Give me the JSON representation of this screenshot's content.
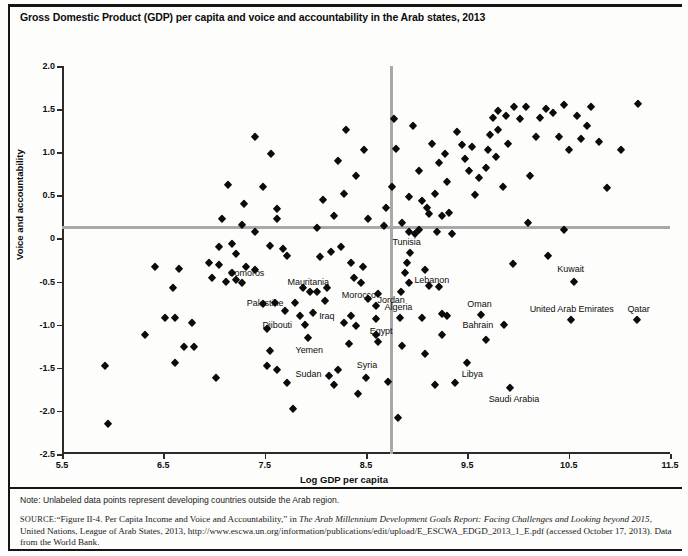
{
  "figure": {
    "title": "Gross Domestic Product (GDP) per capita and voice and accountability in the Arab states, 2013",
    "note": "Note: Unlabeled data points represent developing countries outside the Arab region.",
    "source": {
      "tag": "SOURCE:",
      "part1": "“Figure II-4. Per Capita Income and Voice and Accountability,” in ",
      "italic1": "The Arab Millennium Development Goals Report: Facing Challenges and Looking beyond 2015",
      "part2": ", United Nations, League of Arab States, 2013, http://www.escwa.un.org/information/publications/edit/upload/E_ESCWA_EDGD_2013_1_E.pdf (accessed October 17, 2013). Data from the World Bank."
    },
    "colors": {
      "marker": "#0b0b0b",
      "reference_line": "#a9a9a9",
      "axis": "#2b2b2b",
      "background": "#fdfdfc"
    }
  },
  "chart_data": {
    "type": "scatter",
    "title": "Gross Domestic Product (GDP) per capita and voice and accountability in the Arab states, 2013",
    "xlabel": "Log GDP per capita",
    "ylabel": "Voice and accountability",
    "xlim": [
      5.5,
      11.5
    ],
    "ylim": [
      -2.5,
      2.0
    ],
    "xticks": [
      "5.5",
      "6.5",
      "7.5",
      "8.5",
      "9.5",
      "10.5",
      "11.5"
    ],
    "xtick_values": [
      5.5,
      6.5,
      7.5,
      8.5,
      9.5,
      10.5,
      11.5
    ],
    "yticks": [
      "2.0",
      "1.5",
      "1.0",
      "0.5",
      "0",
      "-0.5",
      "-1.0",
      "-1.5",
      "-2.0",
      "-2.5"
    ],
    "ytick_values": [
      2.0,
      1.5,
      1.0,
      0.5,
      0,
      -0.5,
      -1.0,
      -1.5,
      -2.0,
      -2.5
    ],
    "grid": false,
    "legend": null,
    "reference_lines": {
      "horizontal_y": 0.13,
      "vertical_x": 8.75
    },
    "labeled_points": [
      {
        "label": "Comoros",
        "x": 7.18,
        "y": -0.4,
        "label_dx": 14,
        "label_dy": 0
      },
      {
        "label": "Mauritania",
        "x": 7.95,
        "y": -0.62,
        "label_dx": -2,
        "label_dy": -10
      },
      {
        "label": "Palestine",
        "x": 7.8,
        "y": -0.75,
        "label_dx": -30,
        "label_dy": 0
      },
      {
        "label": "Djibouti",
        "x": 7.9,
        "y": -1.0,
        "label_dx": -28,
        "label_dy": 0
      },
      {
        "label": "Yemen",
        "x": 7.93,
        "y": -1.15,
        "label_dx": 1,
        "label_dy": 12
      },
      {
        "label": "Sudan",
        "x": 8.13,
        "y": -1.6,
        "label_dx": -20,
        "label_dy": -2
      },
      {
        "label": "Morocco",
        "x": 8.45,
        "y": -0.52,
        "label_dx": -2,
        "label_dy": 12
      },
      {
        "label": "Jordan",
        "x": 8.62,
        "y": -0.65,
        "label_dx": 13,
        "label_dy": 6
      },
      {
        "label": "Iraq",
        "x": 8.35,
        "y": -0.9,
        "label_dx": -24,
        "label_dy": 0
      },
      {
        "label": "Egypt",
        "x": 8.6,
        "y": -0.93,
        "label_dx": 5,
        "label_dy": 12
      },
      {
        "label": "Syria",
        "x": 8.5,
        "y": -1.62,
        "label_dx": 1,
        "label_dy": -13
      },
      {
        "label": "Algeria",
        "x": 8.84,
        "y": -0.92,
        "label_dx": -2,
        "label_dy": -11
      },
      {
        "label": "Tunisia",
        "x": 8.93,
        "y": -0.17,
        "label_dx": -3,
        "label_dy": -11
      },
      {
        "label": "Lebanon",
        "x": 9.08,
        "y": -0.37,
        "label_dx": 7,
        "label_dy": 10
      },
      {
        "label": "Oman",
        "x": 9.63,
        "y": -0.89,
        "label_dx": -1,
        "label_dy": -11
      },
      {
        "label": "Bahrain",
        "x": 9.86,
        "y": -1.0,
        "label_dx": -26,
        "label_dy": 0
      },
      {
        "label": "Libya",
        "x": 9.5,
        "y": -1.44,
        "label_dx": 5,
        "label_dy": 11
      },
      {
        "label": "Saudi Arabia",
        "x": 9.92,
        "y": -1.73,
        "label_dx": 4,
        "label_dy": 11
      },
      {
        "label": "Kuwait",
        "x": 10.55,
        "y": -0.5,
        "label_dx": -3,
        "label_dy": -13
      },
      {
        "label": "United Arab Emirates",
        "x": 10.52,
        "y": -0.95,
        "label_dx": 1,
        "label_dy": -11
      },
      {
        "label": "Qatar",
        "x": 11.17,
        "y": -0.95,
        "label_dx": 2,
        "label_dy": -11
      }
    ],
    "unlabeled_points": [
      {
        "x": 5.92,
        "y": -1.48
      },
      {
        "x": 5.95,
        "y": -2.15
      },
      {
        "x": 6.42,
        "y": -0.33
      },
      {
        "x": 6.65,
        "y": -0.35
      },
      {
        "x": 6.6,
        "y": -0.58
      },
      {
        "x": 6.52,
        "y": -0.92
      },
      {
        "x": 6.62,
        "y": -0.92
      },
      {
        "x": 6.78,
        "y": -0.98
      },
      {
        "x": 6.32,
        "y": -1.12
      },
      {
        "x": 6.7,
        "y": -1.26
      },
      {
        "x": 6.8,
        "y": -1.26
      },
      {
        "x": 6.62,
        "y": -1.44
      },
      {
        "x": 7.02,
        "y": -1.62
      },
      {
        "x": 6.95,
        "y": -0.28
      },
      {
        "x": 7.05,
        "y": -0.31
      },
      {
        "x": 6.98,
        "y": -0.46
      },
      {
        "x": 7.12,
        "y": -0.5
      },
      {
        "x": 7.22,
        "y": -0.48
      },
      {
        "x": 7.28,
        "y": -0.52
      },
      {
        "x": 7.32,
        "y": -0.33
      },
      {
        "x": 7.4,
        "y": -0.37
      },
      {
        "x": 7.22,
        "y": -0.18
      },
      {
        "x": 7.05,
        "y": -0.1
      },
      {
        "x": 7.18,
        "y": -0.06
      },
      {
        "x": 7.4,
        "y": 0.08
      },
      {
        "x": 7.28,
        "y": 0.16
      },
      {
        "x": 7.08,
        "y": 0.22
      },
      {
        "x": 7.3,
        "y": 0.4
      },
      {
        "x": 7.14,
        "y": 0.62
      },
      {
        "x": 7.4,
        "y": 1.18
      },
      {
        "x": 7.48,
        "y": 0.6
      },
      {
        "x": 7.56,
        "y": 0.98
      },
      {
        "x": 7.62,
        "y": 0.34
      },
      {
        "x": 7.62,
        "y": 0.22
      },
      {
        "x": 7.55,
        "y": -0.09
      },
      {
        "x": 7.68,
        "y": -0.12
      },
      {
        "x": 7.72,
        "y": -0.2
      },
      {
        "x": 7.48,
        "y": -0.76
      },
      {
        "x": 7.6,
        "y": -0.75
      },
      {
        "x": 7.7,
        "y": -0.84
      },
      {
        "x": 7.85,
        "y": -0.9
      },
      {
        "x": 7.52,
        "y": -1.05
      },
      {
        "x": 7.55,
        "y": -1.3
      },
      {
        "x": 7.52,
        "y": -1.48
      },
      {
        "x": 7.62,
        "y": -1.52
      },
      {
        "x": 7.72,
        "y": -1.68
      },
      {
        "x": 7.78,
        "y": -1.98
      },
      {
        "x": 7.88,
        "y": -0.58
      },
      {
        "x": 8.02,
        "y": -0.62
      },
      {
        "x": 8.1,
        "y": -0.72
      },
      {
        "x": 7.98,
        "y": -0.86
      },
      {
        "x": 8.12,
        "y": -0.58
      },
      {
        "x": 8.05,
        "y": -0.21
      },
      {
        "x": 8.15,
        "y": -0.16
      },
      {
        "x": 8.25,
        "y": -0.1
      },
      {
        "x": 8.02,
        "y": 0.12
      },
      {
        "x": 8.18,
        "y": 0.26
      },
      {
        "x": 8.08,
        "y": 0.45
      },
      {
        "x": 8.28,
        "y": 0.52
      },
      {
        "x": 8.22,
        "y": 0.9
      },
      {
        "x": 8.4,
        "y": 0.72
      },
      {
        "x": 8.3,
        "y": 1.26
      },
      {
        "x": 8.48,
        "y": 1.02
      },
      {
        "x": 8.35,
        "y": -0.28
      },
      {
        "x": 8.47,
        "y": -0.33
      },
      {
        "x": 8.38,
        "y": -0.46
      },
      {
        "x": 8.52,
        "y": -0.7
      },
      {
        "x": 8.6,
        "y": -0.78
      },
      {
        "x": 8.28,
        "y": -0.98
      },
      {
        "x": 8.4,
        "y": -1.02
      },
      {
        "x": 8.33,
        "y": -1.22
      },
      {
        "x": 8.22,
        "y": -1.52
      },
      {
        "x": 8.18,
        "y": -1.7
      },
      {
        "x": 8.42,
        "y": -1.8
      },
      {
        "x": 8.6,
        "y": -1.12
      },
      {
        "x": 8.62,
        "y": -1.2
      },
      {
        "x": 8.72,
        "y": -1.66
      },
      {
        "x": 8.7,
        "y": 0.35
      },
      {
        "x": 8.68,
        "y": 0.14
      },
      {
        "x": 8.52,
        "y": 0.22
      },
      {
        "x": 8.76,
        "y": 0.6
      },
      {
        "x": 8.8,
        "y": 1.04
      },
      {
        "x": 8.78,
        "y": 1.38
      },
      {
        "x": 8.86,
        "y": 0.18
      },
      {
        "x": 8.92,
        "y": 0.08
      },
      {
        "x": 8.98,
        "y": 0.05
      },
      {
        "x": 9.02,
        "y": 0.1
      },
      {
        "x": 8.92,
        "y": 0.48
      },
      {
        "x": 9.05,
        "y": 0.44
      },
      {
        "x": 9.1,
        "y": 0.35
      },
      {
        "x": 9.12,
        "y": 0.28
      },
      {
        "x": 9.02,
        "y": 0.78
      },
      {
        "x": 8.9,
        "y": -0.28
      },
      {
        "x": 8.88,
        "y": -0.4
      },
      {
        "x": 8.92,
        "y": -0.52
      },
      {
        "x": 8.85,
        "y": -0.62
      },
      {
        "x": 8.86,
        "y": -1.25
      },
      {
        "x": 8.82,
        "y": -2.08
      },
      {
        "x": 8.96,
        "y": 1.3
      },
      {
        "x": 9.15,
        "y": 1.1
      },
      {
        "x": 9.22,
        "y": 0.88
      },
      {
        "x": 9.28,
        "y": 0.98
      },
      {
        "x": 9.3,
        "y": 0.66
      },
      {
        "x": 9.18,
        "y": 0.52
      },
      {
        "x": 9.25,
        "y": 0.26
      },
      {
        "x": 9.32,
        "y": 0.3
      },
      {
        "x": 9.2,
        "y": 0.08
      },
      {
        "x": 9.35,
        "y": 0.05
      },
      {
        "x": 9.12,
        "y": -0.55
      },
      {
        "x": 9.22,
        "y": -0.56
      },
      {
        "x": 9.05,
        "y": -0.92
      },
      {
        "x": 9.25,
        "y": -0.88
      },
      {
        "x": 9.3,
        "y": -0.9
      },
      {
        "x": 9.25,
        "y": -1.12
      },
      {
        "x": 9.08,
        "y": -1.34
      },
      {
        "x": 9.18,
        "y": -1.7
      },
      {
        "x": 9.38,
        "y": -1.68
      },
      {
        "x": 9.4,
        "y": 1.24
      },
      {
        "x": 9.48,
        "y": 0.92
      },
      {
        "x": 9.45,
        "y": 1.08
      },
      {
        "x": 9.52,
        "y": 0.78
      },
      {
        "x": 9.55,
        "y": 1.06
      },
      {
        "x": 9.58,
        "y": 0.5
      },
      {
        "x": 9.62,
        "y": 0.7
      },
      {
        "x": 9.68,
        "y": 0.82
      },
      {
        "x": 9.7,
        "y": 1.02
      },
      {
        "x": 9.72,
        "y": 1.2
      },
      {
        "x": 9.75,
        "y": 1.4
      },
      {
        "x": 9.8,
        "y": 1.26
      },
      {
        "x": 9.8,
        "y": 1.48
      },
      {
        "x": 9.88,
        "y": 1.42
      },
      {
        "x": 9.78,
        "y": 0.95
      },
      {
        "x": 9.85,
        "y": 0.6
      },
      {
        "x": 9.9,
        "y": 1.1
      },
      {
        "x": 9.96,
        "y": 1.52
      },
      {
        "x": 10.02,
        "y": 1.38
      },
      {
        "x": 10.08,
        "y": 1.52
      },
      {
        "x": 10.12,
        "y": 0.72
      },
      {
        "x": 10.18,
        "y": 1.18
      },
      {
        "x": 10.22,
        "y": 1.4
      },
      {
        "x": 10.28,
        "y": 1.5
      },
      {
        "x": 10.35,
        "y": 1.45
      },
      {
        "x": 10.4,
        "y": 1.18
      },
      {
        "x": 10.45,
        "y": 1.55
      },
      {
        "x": 10.5,
        "y": 1.02
      },
      {
        "x": 10.58,
        "y": 1.42
      },
      {
        "x": 10.62,
        "y": 1.15
      },
      {
        "x": 10.68,
        "y": 1.3
      },
      {
        "x": 10.72,
        "y": 1.52
      },
      {
        "x": 10.8,
        "y": 1.12
      },
      {
        "x": 10.88,
        "y": 0.58
      },
      {
        "x": 11.02,
        "y": 1.02
      },
      {
        "x": 11.18,
        "y": 1.56
      },
      {
        "x": 10.45,
        "y": 0.1
      },
      {
        "x": 10.1,
        "y": 0.18
      },
      {
        "x": 9.95,
        "y": -0.3
      },
      {
        "x": 10.3,
        "y": -0.2
      },
      {
        "x": 9.68,
        "y": -1.18
      }
    ]
  }
}
